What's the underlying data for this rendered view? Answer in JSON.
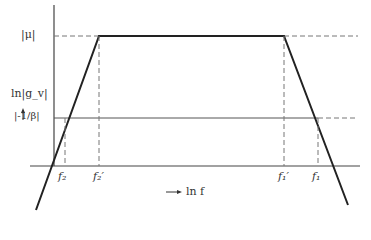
{
  "diagram": {
    "type": "frequency-response-plot",
    "y_axis_label": "ln|g_v|",
    "x_axis_label": "ln f",
    "levels": {
      "mu": "|μ|",
      "beta": "|-1/β|"
    },
    "frequency_markers": [
      {
        "id": "f2",
        "label": "f₂"
      },
      {
        "id": "f2p",
        "label": "f₂′"
      },
      {
        "id": "f1p",
        "label": "f₁′"
      },
      {
        "id": "f1",
        "label": "f₁"
      }
    ],
    "colors": {
      "line": "#222222",
      "dashed": "#777777",
      "axis": "#444444",
      "text": "#333333"
    }
  }
}
